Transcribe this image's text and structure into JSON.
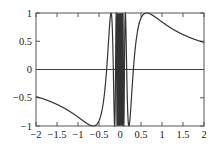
{
  "chart_data": {
    "type": "line",
    "title": "",
    "xlabel": "",
    "ylabel": "",
    "function": "y = sin(1/x)",
    "xlim": [
      -2,
      2
    ],
    "ylim": [
      -1,
      1
    ],
    "grid": false,
    "legend": null,
    "xticks": [
      -2,
      -1.5,
      -1,
      -0.5,
      0,
      0.5,
      1,
      1.5,
      2
    ],
    "xtick_labels": [
      "−2",
      "−1.5",
      "−1",
      "−0.5",
      "0",
      "0.5",
      "1",
      "1.5",
      "2"
    ],
    "yticks": [
      -1,
      -0.5,
      0,
      0.5,
      1
    ],
    "ytick_labels": [
      "−1",
      "−0.5",
      "0",
      "0.5",
      "1"
    ],
    "reference_lines": [
      {
        "orientation": "horizontal",
        "y": 0
      }
    ],
    "series": [
      {
        "name": "sin(1/x)",
        "sample_points": [
          {
            "x": -2,
            "y": -0.479
          },
          {
            "x": -1.5,
            "y": -0.618
          },
          {
            "x": -1,
            "y": -0.841
          },
          {
            "x": -0.637,
            "y": -1
          },
          {
            "x": -0.5,
            "y": -0.909
          },
          {
            "x": -0.318,
            "y": 0
          },
          {
            "x": 0.318,
            "y": 0
          },
          {
            "x": 0.5,
            "y": 0.909
          },
          {
            "x": 0.637,
            "y": 1
          },
          {
            "x": 1,
            "y": 0.841
          },
          {
            "x": 1.5,
            "y": 0.618
          },
          {
            "x": 2,
            "y": 0.479
          }
        ],
        "color": "#333333"
      }
    ]
  },
  "colors": {
    "curve": "#333333",
    "axes": "#555555",
    "zero_line": "#444444"
  }
}
